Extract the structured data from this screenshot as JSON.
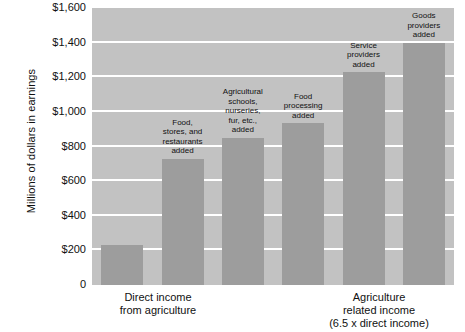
{
  "chart_data": {
    "type": "bar",
    "title": "",
    "xlabel": "",
    "ylabel": "Millions of dollars in earnings",
    "ylim": [
      0,
      1600
    ],
    "ytick_values": [
      0,
      200,
      400,
      600,
      800,
      1000,
      1200,
      1400,
      1600
    ],
    "ytick_labels": [
      "0",
      "$200",
      "$400",
      "$600",
      "$800",
      "$1,000",
      "$1,200",
      "$1,400",
      "$1,600"
    ],
    "grid": true,
    "legend": "none",
    "categories": [
      "Direct income from agriculture",
      "Food, stores, and restaurants added",
      "Agricultural schools, nurseries, fur, etc., added",
      "Food processing added",
      "Service providers added",
      "Goods providers added"
    ],
    "values": [
      230,
      730,
      850,
      935,
      1230,
      1400
    ],
    "annotations": [
      "",
      "Food,\nstores, and\nrestaurants\nadded",
      "Agricultural\nschools,\nnurseries,\nfur, etc.,\nadded",
      "Food\nprocessing\nadded",
      "Service\nproviders\nadded",
      "Goods\nproviders\nadded"
    ],
    "x_group_labels": [
      "Direct income\nfrom agriculture",
      "Agriculture\nrelated income\n(6.5 x direct income)"
    ],
    "colors": {
      "plot_background": "#c2c2c2",
      "bar_fill": "#9d9d9d",
      "gridline": "#ffffff",
      "text": "#111111",
      "page_background": "#ffffff"
    }
  },
  "axis": {
    "y_title": "Millions of dollars in earnings",
    "ticks": [
      {
        "label": "$1,600",
        "value": 1600
      },
      {
        "label": "$1,400",
        "value": 1400
      },
      {
        "label": "$1,200",
        "value": 1200
      },
      {
        "label": "$1,000",
        "value": 1000
      },
      {
        "label": "$800",
        "value": 800
      },
      {
        "label": "$600",
        "value": 600
      },
      {
        "label": "$400",
        "value": 400
      },
      {
        "label": "$200",
        "value": 200
      },
      {
        "label": "0",
        "value": 0
      }
    ]
  },
  "bars": [
    {
      "caption": "",
      "value": 230
    },
    {
      "caption": "Food,\nstores, and\nrestaurants\nadded",
      "value": 730
    },
    {
      "caption": "Agricultural\nschools,\nnurseries,\nfur, etc.,\nadded",
      "value": 850
    },
    {
      "caption": "Food\nprocessing\nadded",
      "value": 935
    },
    {
      "caption": "Service\nproviders\nadded",
      "value": 1230
    },
    {
      "caption": "Goods\nproviders\nadded",
      "value": 1400
    }
  ],
  "x_labels": {
    "left": "Direct income\nfrom agriculture",
    "right": "Agriculture\nrelated income\n(6.5 x direct income)"
  }
}
